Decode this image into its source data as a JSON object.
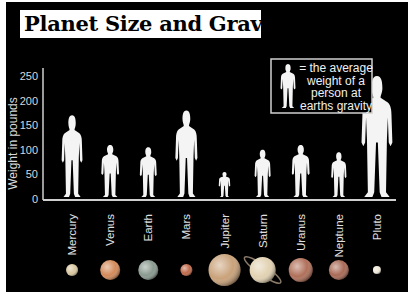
{
  "chart_data": {
    "type": "bar",
    "title": "Planet Size and Gravity",
    "xlabel": "",
    "ylabel": "Weight  in pounds",
    "ylim": [
      0,
      250
    ],
    "yticks": [
      "0",
      "50",
      "100",
      "150",
      "200",
      "250"
    ],
    "categories": [
      "Mercury",
      "Venus",
      "Earth",
      "Mars",
      "Jupiter",
      "Saturn",
      "Uranus",
      "Neptune",
      "Pluto"
    ],
    "values": [
      170,
      110,
      105,
      180,
      55,
      100,
      110,
      95,
      250
    ],
    "legend": {
      "lines": [
        "= the average",
        "weight of a",
        "person at",
        "earths gravity"
      ],
      "placement": "top-right"
    },
    "planets": [
      {
        "name": "Mercury",
        "color": "#d9c7a0"
      },
      {
        "name": "Venus",
        "color": "#d48a5a"
      },
      {
        "name": "Earth",
        "color": "#8a9a90"
      },
      {
        "name": "Mars",
        "color": "#c06a4a"
      },
      {
        "name": "Jupiter",
        "color": "#c9a27a"
      },
      {
        "name": "Saturn",
        "color": "#e2d2b2"
      },
      {
        "name": "Uranus",
        "color": "#b0705a"
      },
      {
        "name": "Neptune",
        "color": "#a86a56"
      },
      {
        "name": "Pluto",
        "color": "#f0e8d8"
      }
    ],
    "grid": false
  }
}
